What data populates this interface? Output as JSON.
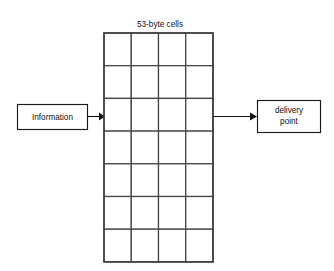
{
  "diagram": {
    "title_label": "53-byte cells",
    "source_box": {
      "label": "Information"
    },
    "destination_box": {
      "line1": "delivery",
      "line2": "point"
    },
    "cell_grid": {
      "columns": 4,
      "rows": 7,
      "total_cells": 28,
      "cell_label": ""
    },
    "arrows": [
      {
        "name": "information-to-grid",
        "direction": "right"
      },
      {
        "name": "grid-to-delivery",
        "direction": "right"
      }
    ],
    "colors": {
      "background": "#ffffff",
      "stroke": "#1a1a1a",
      "grid_stroke": "#454545",
      "text": "#111111"
    }
  }
}
